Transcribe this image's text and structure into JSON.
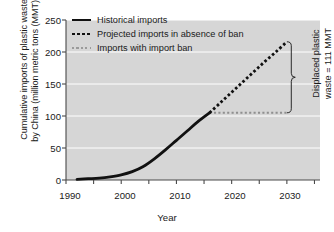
{
  "chart_data": {
    "type": "line",
    "title": "",
    "xlabel": "Year",
    "ylabel": "Cumulative imports of plastic waste\nby China (million metric tons (MMT))",
    "xlim": [
      1990,
      2036
    ],
    "ylim": [
      0,
      250
    ],
    "xticks": [
      1990,
      2000,
      2010,
      2020,
      2030
    ],
    "xtick_labels": [
      "1990",
      "2000",
      "2010",
      "2020",
      "2030"
    ],
    "xminor_ticks": [
      1995,
      2005,
      2015,
      2025,
      2035
    ],
    "yticks": [
      0,
      50,
      100,
      150,
      200,
      250
    ],
    "ytick_labels": [
      "0",
      "50",
      "100",
      "150",
      "200",
      "250"
    ],
    "grid": "horizontal-white",
    "legend_position": "top-left-inside",
    "plot_bg": "#d6d6d6",
    "grid_color": "#ffffff",
    "series": [
      {
        "name": "Historical imports",
        "style": "solid",
        "color": "#111111",
        "width": 2.8,
        "x": [
          1992,
          1994,
          1996,
          1998,
          2000,
          2002,
          2004,
          2006,
          2008,
          2010,
          2012,
          2014,
          2016
        ],
        "y": [
          1,
          2,
          3,
          5,
          8,
          13,
          21,
          33,
          47,
          62,
          77,
          92,
          105
        ]
      },
      {
        "name": "Projected imports in absence of ban",
        "style": "dotted-thick",
        "color": "#111111",
        "width": 2.8,
        "x": [
          2016,
          2018,
          2020,
          2022,
          2024,
          2026,
          2028,
          2030
        ],
        "y": [
          105,
          121,
          137,
          153,
          169,
          185,
          200,
          216
        ]
      },
      {
        "name": "Imports with import ban",
        "style": "dotted-thin",
        "color": "#8f8f8f",
        "width": 1.9,
        "x": [
          2016,
          2030
        ],
        "y": [
          105,
          105
        ]
      }
    ],
    "annotations": [
      {
        "name": "displaced-plastic-waste",
        "text": "Displaced plastic\nwaste = 111 MMT",
        "brace_x": 2030.8,
        "brace_y_top": 216,
        "brace_y_bottom": 105,
        "value": 111,
        "unit": "MMT"
      }
    ]
  },
  "legend": {
    "items": [
      {
        "label": "Historical imports",
        "swatch": "solid"
      },
      {
        "label": "Projected imports in absence of ban",
        "swatch": "dotted-thick"
      },
      {
        "label": "Imports with import ban",
        "swatch": "dotted-thin"
      }
    ]
  },
  "axes": {
    "y_title": "Cumulative imports of plastic waste\nby China (million metric tons (MMT))",
    "x_title": "Year",
    "y_tick_labels": [
      "250",
      "200",
      "150",
      "100",
      "50",
      "0"
    ],
    "x_tick_labels": [
      "1990",
      "2000",
      "2010",
      "2020",
      "2030"
    ]
  },
  "annotation": {
    "text": "Displaced plastic\nwaste = 111 MMT"
  }
}
